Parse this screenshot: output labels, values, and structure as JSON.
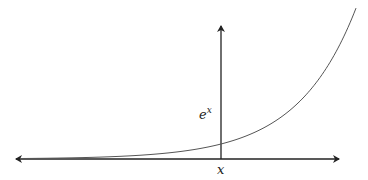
{
  "diagram": {
    "title": "",
    "function": "exponential",
    "y_axis_label_base": "e",
    "y_axis_label_exponent": "x",
    "x_axis_label": "x",
    "colors": {
      "axes": "#222222",
      "curve": "#555555",
      "background": "#ffffff"
    }
  }
}
